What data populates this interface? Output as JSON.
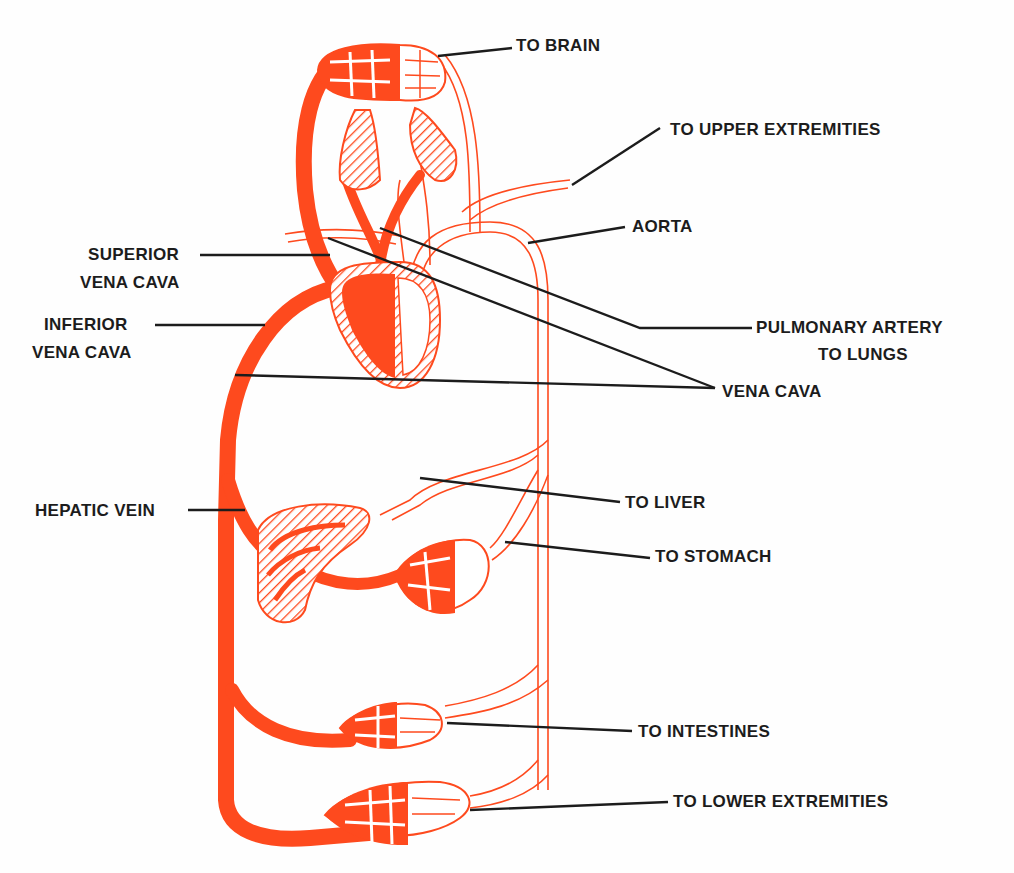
{
  "diagram": {
    "colors": {
      "vein": "#fe4a1e",
      "artery_outline": "#fe4a1e",
      "leader_line": "#1c1c1c",
      "background": "#fefefe"
    },
    "labels": {
      "to_brain": "TO BRAIN",
      "to_upper_extremities": "TO UPPER EXTREMITIES",
      "aorta": "AORTA",
      "superior_vena_cava_1": "SUPERIOR",
      "superior_vena_cava_2": "VENA CAVA",
      "inferior_vena_cava_1": "INFERIOR",
      "inferior_vena_cava_2": "VENA CAVA",
      "pulmonary_artery_1": "PULMONARY ARTERY",
      "pulmonary_artery_2": "TO LUNGS",
      "vena_cava": "VENA CAVA",
      "hepatic_vein": "HEPATIC VEIN",
      "to_liver": "TO LIVER",
      "to_stomach": "TO STOMACH",
      "to_intestines": "TO INTESTINES",
      "to_lower_extremities": "TO LOWER EXTREMITIES"
    },
    "nodes": [
      {
        "id": "brain",
        "label": "TO BRAIN"
      },
      {
        "id": "lungs",
        "label": "PULMONARY ARTERY TO LUNGS"
      },
      {
        "id": "heart",
        "label": ""
      },
      {
        "id": "upper-extremities",
        "label": "TO UPPER EXTREMITIES"
      },
      {
        "id": "liver",
        "label": "TO LIVER"
      },
      {
        "id": "stomach",
        "label": "TO STOMACH"
      },
      {
        "id": "intestines",
        "label": "TO INTESTINES"
      },
      {
        "id": "lower-extremities",
        "label": "TO LOWER EXTREMITIES"
      }
    ],
    "edges": [
      {
        "from": "heart",
        "to": "brain",
        "via": "AORTA"
      },
      {
        "from": "heart",
        "to": "upper-extremities",
        "via": "AORTA"
      },
      {
        "from": "heart",
        "to": "lungs",
        "via": "PULMONARY ARTERY"
      },
      {
        "from": "heart",
        "to": "liver",
        "via": "AORTA"
      },
      {
        "from": "heart",
        "to": "stomach",
        "via": "AORTA"
      },
      {
        "from": "heart",
        "to": "intestines",
        "via": "AORTA"
      },
      {
        "from": "heart",
        "to": "lower-extremities",
        "via": "AORTA"
      },
      {
        "from": "brain",
        "to": "heart",
        "via": "SUPERIOR VENA CAVA"
      },
      {
        "from": "stomach",
        "to": "liver",
        "via": "portal"
      },
      {
        "from": "liver",
        "to": "heart",
        "via": "HEPATIC VEIN"
      },
      {
        "from": "intestines",
        "to": "heart",
        "via": "INFERIOR VENA CAVA"
      },
      {
        "from": "lower-extremities",
        "to": "heart",
        "via": "INFERIOR VENA CAVA"
      }
    ]
  }
}
